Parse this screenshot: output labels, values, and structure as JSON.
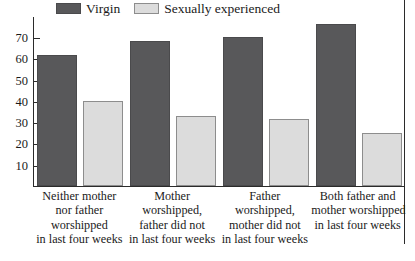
{
  "chart_data": {
    "type": "bar",
    "title": "",
    "xlabel": "",
    "ylabel": "",
    "ylim": [
      0,
      80
    ],
    "yticks": [
      10,
      20,
      30,
      40,
      50,
      60,
      70
    ],
    "grid": false,
    "legend_position": "top-left",
    "categories": [
      "Neither mother nor father worshipped in last four weeks",
      "Mother worshipped, father did not in last four weeks",
      "Father worshipped, mother did not in last four weeks",
      "Both father and mother worshipped in last four weeks"
    ],
    "category_lines": [
      [
        "Neither mother",
        "nor father",
        "worshipped",
        "in last four weeks"
      ],
      [
        "Mother",
        "worshipped,",
        "father did not",
        "in last four weeks"
      ],
      [
        "Father",
        "worshipped,",
        "mother did not",
        "in last four weeks"
      ],
      [
        "Both father and",
        "mother worshipped",
        "in last four weeks"
      ]
    ],
    "series": [
      {
        "name": "Virgin",
        "color": "#58585a",
        "values": [
          61.5,
          68,
          70,
          76
        ]
      },
      {
        "name": "Sexually experienced",
        "color": "#dcdcdc",
        "values": [
          40,
          33,
          31.5,
          25
        ]
      }
    ]
  },
  "legend": {
    "items": [
      {
        "label": "Virgin",
        "color": "#58585a",
        "border": "#4a4a4c"
      },
      {
        "label": "Sexually experienced",
        "color": "#dcdcdc",
        "border": "#8d8d8d"
      }
    ]
  },
  "axis": {
    "tick_labels": [
      "70",
      "60",
      "50",
      "40",
      "30",
      "20",
      "10"
    ]
  },
  "colors": {
    "virgin": "#58585a",
    "experienced": "#dcdcdc",
    "axis": "#2b2b2b",
    "background": "#ffffff"
  }
}
